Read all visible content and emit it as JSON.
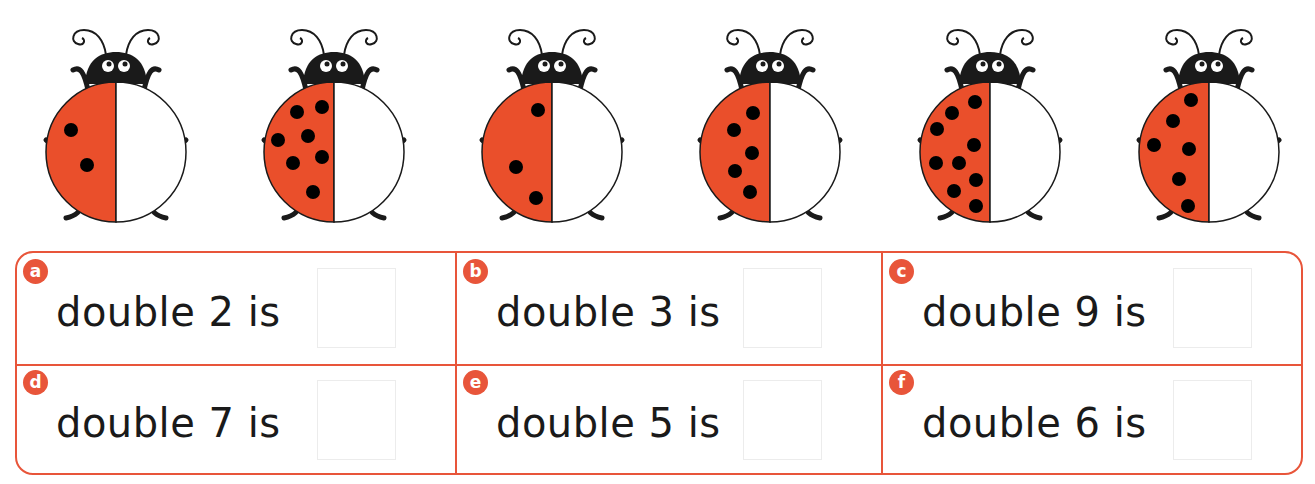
{
  "worksheet": {
    "colors": {
      "accent": "#e8553a",
      "ladybird_red": "#ea4f2b",
      "ink": "#1a1a1a",
      "answer_box_border": "#ececec"
    },
    "ladybirds": [
      {
        "id": 1,
        "spots_on_red_half": 2
      },
      {
        "id": 2,
        "spots_on_red_half": 7
      },
      {
        "id": 3,
        "spots_on_red_half": 3
      },
      {
        "id": 4,
        "spots_on_red_half": 5
      },
      {
        "id": 5,
        "spots_on_red_half": 9
      },
      {
        "id": 6,
        "spots_on_red_half": 6
      }
    ],
    "questions": [
      {
        "letter": "a",
        "text": "double 2 is",
        "answer": ""
      },
      {
        "letter": "b",
        "text": "double 3 is",
        "answer": ""
      },
      {
        "letter": "c",
        "text": "double 9 is",
        "answer": ""
      },
      {
        "letter": "d",
        "text": "double 7 is",
        "answer": ""
      },
      {
        "letter": "e",
        "text": "double 5 is",
        "answer": ""
      },
      {
        "letter": "f",
        "text": "double 6 is",
        "answer": ""
      }
    ]
  }
}
